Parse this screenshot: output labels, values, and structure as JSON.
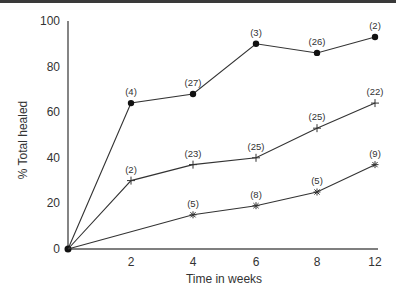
{
  "chart_data": {
    "type": "line",
    "title": "",
    "xlabel": "Time in weeks",
    "ylabel": "% Total healed",
    "x": [
      0,
      2,
      4,
      6,
      8,
      12
    ],
    "x_tick_labels": [
      "2",
      "4",
      "6",
      "8",
      "12"
    ],
    "y_tick_labels": [
      "0",
      "20",
      "40",
      "60",
      "80",
      "100"
    ],
    "ylim": [
      0,
      100
    ],
    "grid": false,
    "legend": null,
    "series": [
      {
        "name": "series-circle",
        "marker": "filled-circle",
        "points": [
          {
            "x": 0,
            "y": 0,
            "label": ""
          },
          {
            "x": 2,
            "y": 64,
            "label": "(4)"
          },
          {
            "x": 4,
            "y": 68,
            "label": "(27)"
          },
          {
            "x": 6,
            "y": 90,
            "label": "(3)"
          },
          {
            "x": 8,
            "y": 86,
            "label": "(26)"
          },
          {
            "x": 12,
            "y": 93,
            "label": "(2)"
          }
        ]
      },
      {
        "name": "series-plus",
        "marker": "plus",
        "points": [
          {
            "x": 0,
            "y": 0,
            "label": ""
          },
          {
            "x": 2,
            "y": 30,
            "label": "(2)"
          },
          {
            "x": 4,
            "y": 37,
            "label": "(23)"
          },
          {
            "x": 6,
            "y": 40,
            "label": "(25)"
          },
          {
            "x": 8,
            "y": 53,
            "label": "(25)"
          },
          {
            "x": 12,
            "y": 64,
            "label": "(22)"
          }
        ]
      },
      {
        "name": "series-asterisk",
        "marker": "asterisk",
        "points": [
          {
            "x": 0,
            "y": 0,
            "label": ""
          },
          {
            "x": 4,
            "y": 15,
            "label": "(5)"
          },
          {
            "x": 6,
            "y": 19,
            "label": "(8)"
          },
          {
            "x": 8,
            "y": 25,
            "label": "(5)"
          },
          {
            "x": 12,
            "y": 37,
            "label": "(9)"
          }
        ]
      }
    ]
  },
  "colors": {
    "line": "#333333",
    "text": "#333333",
    "top_border": "#3a3a3a"
  }
}
